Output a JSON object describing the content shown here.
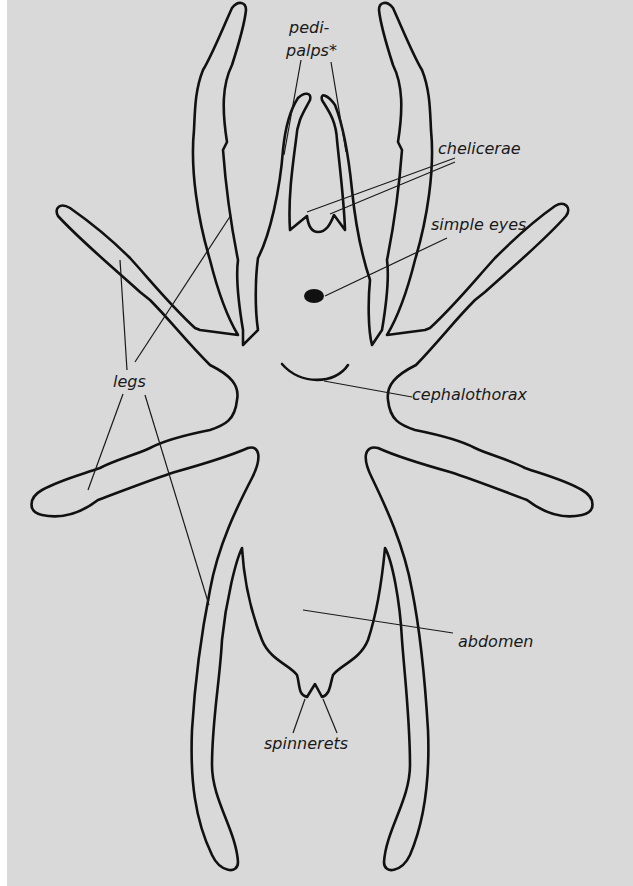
{
  "diagram": {
    "background_color": "#d9d9d9",
    "line_color": "#111111",
    "labels": {
      "pedipalps_line1": "pedi-",
      "pedipalps_line2": "palps*",
      "chelicerae": "chelicerae",
      "simple_eyes": "simple eyes",
      "legs": "legs",
      "cephalothorax": "cephalothorax",
      "abdomen": "abdomen",
      "spinnerets": "spinnerets"
    }
  }
}
